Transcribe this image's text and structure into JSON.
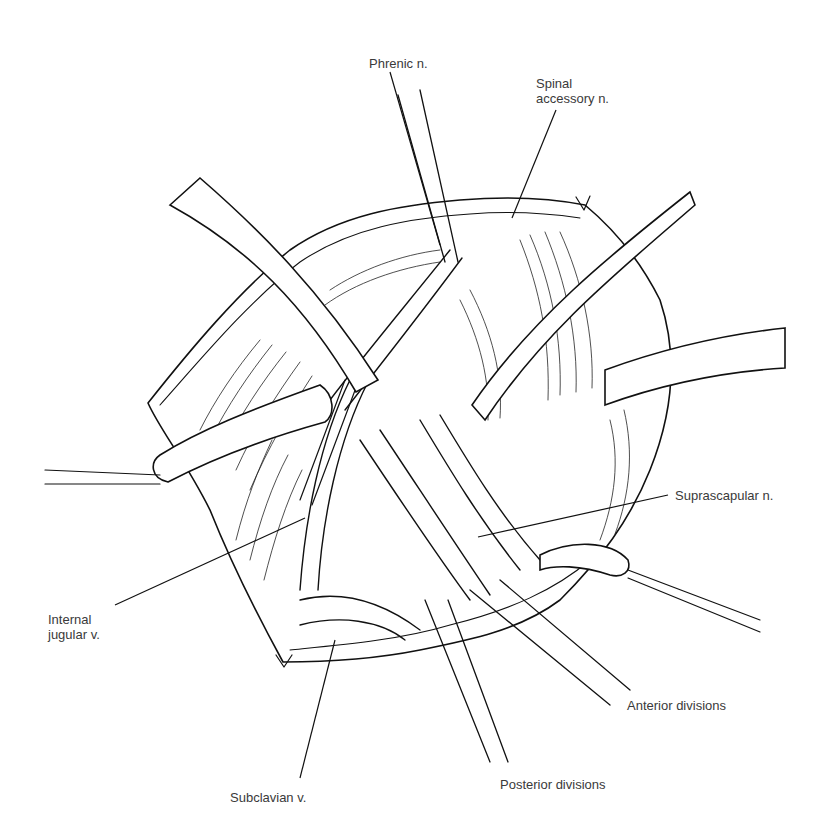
{
  "figure": {
    "type": "anatomical line drawing",
    "ink_color": "#111111",
    "background_color": "#ffffff",
    "label_color": "#3a3a3a"
  },
  "labels": [
    {
      "id": "phrenic",
      "text": "Phrenic n.",
      "x": 369,
      "y": 56
    },
    {
      "id": "spinal-accessory",
      "text": "Spinal\naccessory n.",
      "x": 536,
      "y": 76
    },
    {
      "id": "suprascapular",
      "text": "Suprascapular n.",
      "x": 675,
      "y": 488
    },
    {
      "id": "internal-jugular",
      "text": "Internal\njugular v.",
      "x": 48,
      "y": 612
    },
    {
      "id": "anterior-divisions",
      "text": "Anterior divisions",
      "x": 627,
      "y": 698
    },
    {
      "id": "posterior-divisions",
      "text": "Posterior divisions",
      "x": 500,
      "y": 777
    },
    {
      "id": "subclavian",
      "text": "Subclavian v.",
      "x": 230,
      "y": 790
    }
  ]
}
